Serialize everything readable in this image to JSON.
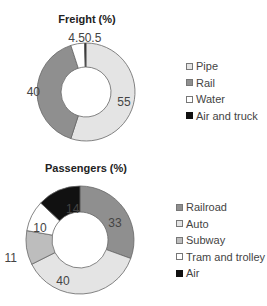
{
  "chart_data": [
    {
      "type": "pie",
      "variant": "donut",
      "title": "Freight (%)",
      "categories": [
        "Pipe",
        "Rail",
        "Water",
        "Air and truck"
      ],
      "values": [
        55,
        40,
        4.5,
        0.5
      ],
      "colors": [
        "#e4e4e4",
        "#8f8f8f",
        "#ffffff",
        "#111111"
      ],
      "data_labels": [
        "55",
        "40",
        "4.5",
        "0.5"
      ],
      "legend_position": "right"
    },
    {
      "type": "pie",
      "variant": "donut",
      "title": "Passengers (%)",
      "categories": [
        "Railroad",
        "Auto",
        "Subway",
        "Tram and trolley",
        "Air"
      ],
      "values": [
        33,
        40,
        11,
        10,
        14
      ],
      "colors": [
        "#8f8f8f",
        "#e4e4e4",
        "#bdbdbd",
        "#ffffff",
        "#111111"
      ],
      "data_labels": [
        "33",
        "40",
        "11",
        "10",
        "14"
      ],
      "legend_position": "right"
    }
  ],
  "freight": {
    "title": "Freight (%)",
    "legend": [
      "Pipe",
      "Rail",
      "Water",
      "Air and truck"
    ]
  },
  "passengers": {
    "title": "Passengers (%)",
    "legend": [
      "Railroad",
      "Auto",
      "Subway",
      "Tram and trolley",
      "Air"
    ]
  }
}
